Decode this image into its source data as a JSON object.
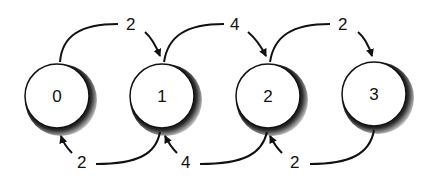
{
  "diagram": {
    "type": "state-transition",
    "nodes": [
      {
        "id": "0",
        "label": "0"
      },
      {
        "id": "1",
        "label": "1"
      },
      {
        "id": "2",
        "label": "2"
      },
      {
        "id": "3",
        "label": "3"
      }
    ],
    "edges_forward": [
      {
        "from": "0",
        "to": "1",
        "label": "2"
      },
      {
        "from": "1",
        "to": "2",
        "label": "4"
      },
      {
        "from": "2",
        "to": "3",
        "label": "2"
      }
    ],
    "edges_backward": [
      {
        "from": "1",
        "to": "0",
        "label": "2"
      },
      {
        "from": "2",
        "to": "1",
        "label": "4"
      },
      {
        "from": "3",
        "to": "2",
        "label": "2"
      }
    ]
  }
}
